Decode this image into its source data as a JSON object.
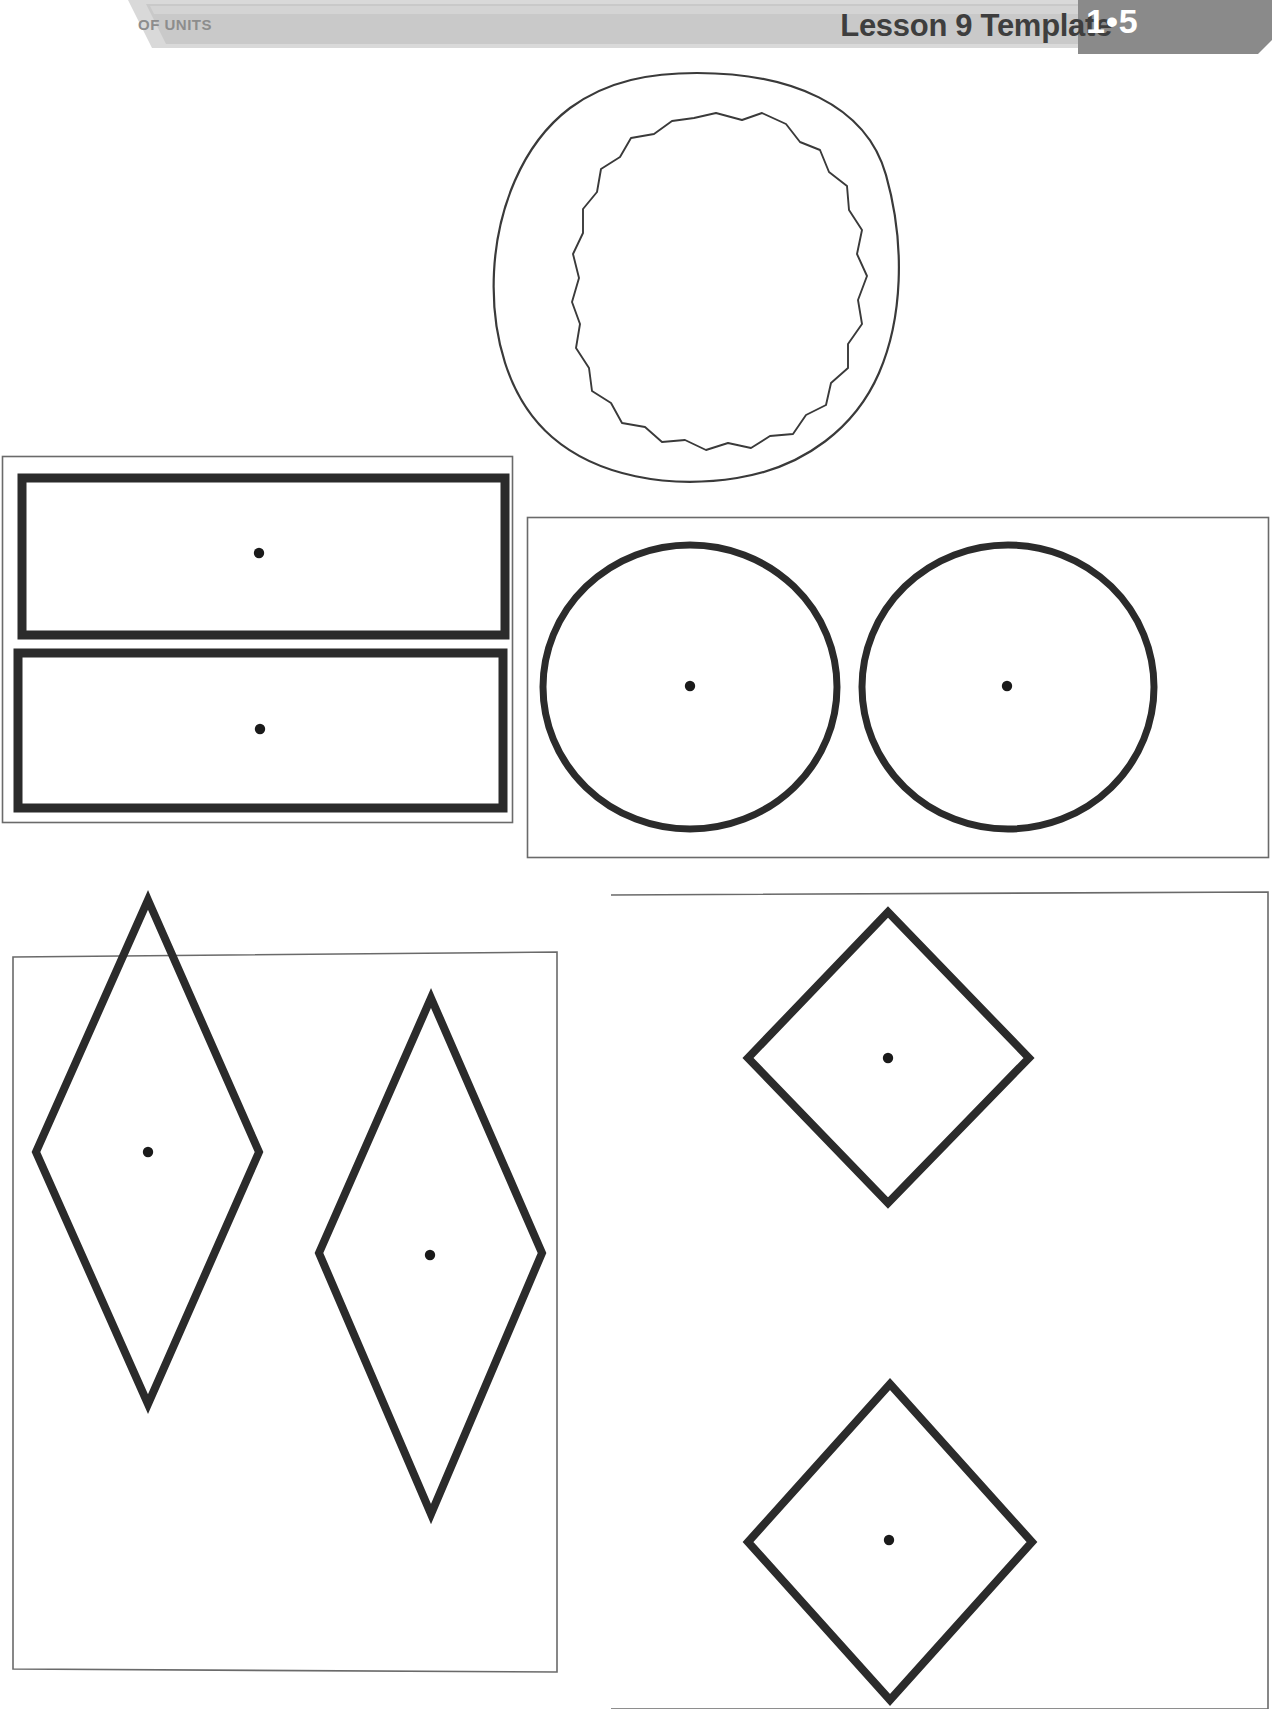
{
  "page": {
    "title": "Lesson 9 Template",
    "width": 1272,
    "height": 1709,
    "background": "#ffffff"
  },
  "header": {
    "left_label": "OF UNITS",
    "title": "Lesson 9 Template",
    "badge": "1•5",
    "band_color": "#c9c9c9",
    "band_color_light": "#d7d7d7",
    "badge_color": "#8a8a8a",
    "title_color": "#3e3e3e",
    "left_label_color": "#8d8d8d",
    "badge_text_color": "#ffffff"
  },
  "shapes": {
    "stroke_color": "#2b2b2b",
    "thin_stroke_color": "#555555",
    "dot_color": "#1a1a1a",
    "panels": [
      {
        "name": "cookie-circle",
        "label": "hand-drawn double circle",
        "count": 1,
        "has_center_dot": false
      },
      {
        "name": "rectangles-panel",
        "label": "two rectangles",
        "count": 2,
        "has_center_dot": true
      },
      {
        "name": "circles-panel",
        "label": "two circles",
        "count": 2,
        "has_center_dot": true
      },
      {
        "name": "rhombuses-panel",
        "label": "two rhombuses",
        "count": 2,
        "has_center_dot": true
      },
      {
        "name": "squares-panel",
        "label": "two squares rotated as diamonds",
        "count": 2,
        "has_center_dot": true
      }
    ]
  }
}
